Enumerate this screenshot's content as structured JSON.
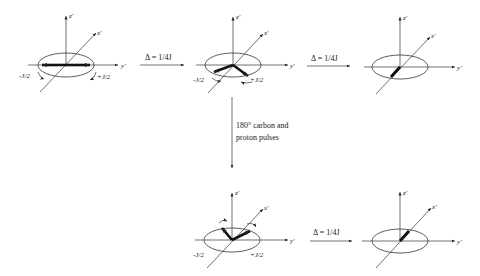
{
  "diagram": {
    "axes": {
      "z": "z'",
      "x": "x'",
      "y": "y'"
    },
    "panels": [
      {
        "id": "p1",
        "labels": {
          "left": "-J/2",
          "right": "+J/2"
        },
        "state": "antiparallel vectors along y' axis"
      },
      {
        "id": "p2",
        "labels": {
          "left": "-J/2",
          "right": "+J/2"
        },
        "state": "vectors dephased toward -x'"
      },
      {
        "id": "p3",
        "labels": {},
        "state": "vectors aligned along -x'"
      },
      {
        "id": "p4",
        "labels": {
          "left": "-J/2",
          "right": "+J/2"
        },
        "state": "vectors refocusing toward +x'"
      },
      {
        "id": "p5",
        "labels": {},
        "state": "vectors aligned along +x'"
      }
    ],
    "transitions": [
      {
        "from": "p1",
        "to": "p2",
        "label": "Δ = 1/4J"
      },
      {
        "from": "p2",
        "to": "p3",
        "label": "Δ = 1/4J"
      },
      {
        "from": "p2",
        "to": "p4",
        "label_line1": "180° carbon and",
        "label_line2": "proton pulses"
      },
      {
        "from": "p4",
        "to": "p5",
        "label": "Δ = 1/4J"
      }
    ]
  }
}
